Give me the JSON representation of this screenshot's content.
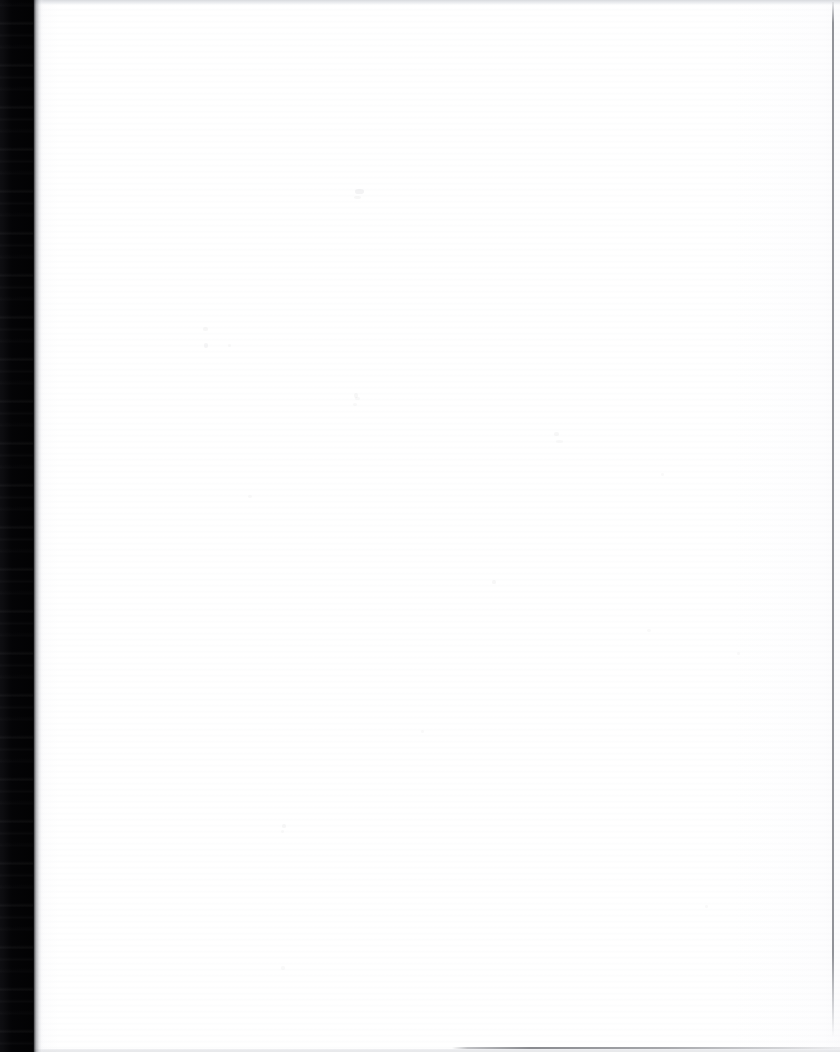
{
  "document": {
    "kind": "scanned-page",
    "title": "Blank scanned page",
    "page_width": 840,
    "page_height": 1052,
    "text_content": "",
    "body_text_present": false,
    "note": "Page surface is blank — no printed text, figures, tables or headings are visible."
  },
  "colors": {
    "page_background": "#ffffff",
    "paper_tone": "#fbfbfc",
    "scanner_bed": "#050507",
    "edge_rule": "#7e8086",
    "top_band": "#d6d8dc",
    "bottom_rule": "#6c6e74"
  },
  "regions": {
    "scanner_bed": {
      "name": "scanner-bed-shadow",
      "x": 0,
      "y": 0,
      "width": 34,
      "height": 1052,
      "description": "Dark scanner bed / book-gutter shadow along the left margin"
    },
    "bed_falloff": {
      "name": "shadow-falloff",
      "x": 33,
      "y": 0,
      "width": 11,
      "height": 1052,
      "description": "Soft gradient from the dark bed into the white paper"
    },
    "paper": {
      "name": "paper-surface",
      "x": 33,
      "y": 0,
      "width": 807,
      "height": 1052,
      "description": "Blank white paper surface"
    },
    "top_band": {
      "name": "top-scan-band",
      "x": 34,
      "y": 0,
      "width": 806,
      "height": 6,
      "description": "Faint light-gray band across the top of the scan"
    },
    "right_rule": {
      "name": "right-edge-rule",
      "x": 832,
      "y": 2,
      "width": 2,
      "height": 1035,
      "description": "Thin gray vertical line near the right page edge"
    },
    "bottom_rule": {
      "name": "bottom-edge-rule",
      "x": 452,
      "y": 1047,
      "width": 388,
      "height": 2,
      "description": "Faint gray horizontal line along the bottom, right half"
    }
  },
  "speckles": [
    {
      "x": 355,
      "y": 189,
      "w": 9,
      "h": 5,
      "opacity": 0.07
    },
    {
      "x": 354,
      "y": 196,
      "w": 7,
      "h": 3,
      "opacity": 0.05
    },
    {
      "x": 203,
      "y": 327,
      "w": 5,
      "h": 4,
      "opacity": 0.05
    },
    {
      "x": 204,
      "y": 343,
      "w": 4,
      "h": 5,
      "opacity": 0.06
    },
    {
      "x": 228,
      "y": 344,
      "w": 3,
      "h": 3,
      "opacity": 0.04
    },
    {
      "x": 354,
      "y": 393,
      "w": 4,
      "h": 5,
      "opacity": 0.05
    },
    {
      "x": 355,
      "y": 397,
      "w": 5,
      "h": 3,
      "opacity": 0.04
    },
    {
      "x": 353,
      "y": 403,
      "w": 4,
      "h": 3,
      "opacity": 0.04
    },
    {
      "x": 554,
      "y": 432,
      "w": 5,
      "h": 4,
      "opacity": 0.05
    },
    {
      "x": 556,
      "y": 440,
      "w": 7,
      "h": 3,
      "opacity": 0.04
    },
    {
      "x": 492,
      "y": 580,
      "w": 4,
      "h": 4,
      "opacity": 0.05
    },
    {
      "x": 248,
      "y": 495,
      "w": 4,
      "h": 3,
      "opacity": 0.04
    },
    {
      "x": 282,
      "y": 824,
      "w": 4,
      "h": 4,
      "opacity": 0.05
    },
    {
      "x": 281,
      "y": 830,
      "w": 3,
      "h": 3,
      "opacity": 0.04
    },
    {
      "x": 281,
      "y": 966,
      "w": 4,
      "h": 4,
      "opacity": 0.04
    },
    {
      "x": 647,
      "y": 629,
      "w": 4,
      "h": 3,
      "opacity": 0.04
    },
    {
      "x": 737,
      "y": 652,
      "w": 3,
      "h": 3,
      "opacity": 0.04
    },
    {
      "x": 421,
      "y": 730,
      "w": 3,
      "h": 3,
      "opacity": 0.04
    },
    {
      "x": 661,
      "y": 473,
      "w": 3,
      "h": 3,
      "opacity": 0.04
    },
    {
      "x": 705,
      "y": 905,
      "w": 3,
      "h": 3,
      "opacity": 0.04
    }
  ]
}
